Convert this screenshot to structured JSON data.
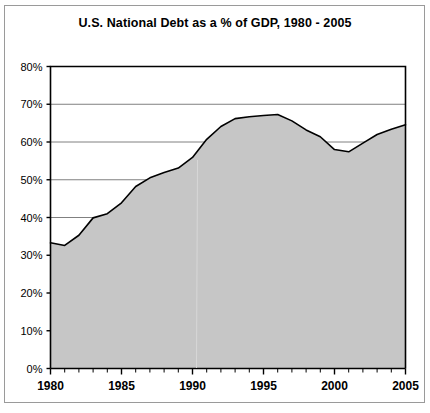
{
  "figure": {
    "title": "U.S. National Debt as a % of GDP, 1980 - 2005",
    "background_color": "#ffffff",
    "frame_color": "#9a9a9a"
  },
  "chart_data": {
    "type": "area",
    "title": "U.S. National Debt as a % of GDP, 1980 - 2005",
    "xlabel": "",
    "ylabel": "",
    "xlim": [
      1980,
      2005
    ],
    "ylim": [
      0,
      80
    ],
    "grid": true,
    "legend": null,
    "fill_color": "#c6c6c6",
    "line_color": "#000000",
    "gridline_color": "#808080",
    "axis_color": "#000000",
    "x": [
      1980,
      1981,
      1982,
      1983,
      1984,
      1985,
      1986,
      1987,
      1988,
      1989,
      1990,
      1991,
      1992,
      1993,
      1994,
      1995,
      1996,
      1997,
      1998,
      1999,
      2000,
      2001,
      2002,
      2003,
      2004,
      2005
    ],
    "values": [
      33.3,
      32.6,
      35.3,
      39.9,
      41.0,
      43.9,
      48.2,
      50.5,
      51.9,
      53.1,
      55.9,
      60.7,
      64.1,
      66.2,
      66.7,
      67.0,
      67.3,
      65.6,
      63.2,
      61.4,
      58.0,
      57.4,
      59.7,
      62.0,
      63.4,
      64.6
    ],
    "categories": [
      "1980",
      "1981",
      "1982",
      "1983",
      "1984",
      "1985",
      "1986",
      "1987",
      "1988",
      "1989",
      "1990",
      "1991",
      "1992",
      "1993",
      "1994",
      "1995",
      "1996",
      "1997",
      "1998",
      "1999",
      "2000",
      "2001",
      "2002",
      "2003",
      "2004",
      "2005"
    ],
    "y_ticks": [
      0,
      10,
      20,
      30,
      40,
      50,
      60,
      70,
      80
    ],
    "y_tick_labels": [
      "0%",
      "10%",
      "20%",
      "30%",
      "40%",
      "50%",
      "60%",
      "70%",
      "80%"
    ],
    "x_ticks_major": [
      1980,
      1985,
      1990,
      1995,
      2000,
      2005
    ],
    "x_tick_labels_major": [
      "1980",
      "1985",
      "1990",
      "1995",
      "2000",
      "2005"
    ],
    "x_ticks_minor_step": 1,
    "units": "percent of GDP"
  }
}
